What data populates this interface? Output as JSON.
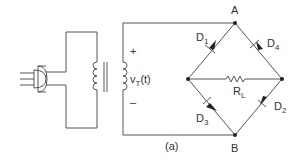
{
  "diagram": {
    "caption": "(a)",
    "source_label": "v",
    "source_sub": "T",
    "source_suffix": "(t)",
    "polarity_plus": "+",
    "polarity_minus": "–",
    "nodes": {
      "top": "A",
      "bottom": "B"
    },
    "diodes": [
      {
        "name": "D",
        "sub": "1"
      },
      {
        "name": "D",
        "sub": "2"
      },
      {
        "name": "D",
        "sub": "3"
      },
      {
        "name": "D",
        "sub": "4"
      }
    ],
    "load": {
      "name": "R",
      "sub": "L"
    },
    "colors": {
      "line": "#555555",
      "text": "#333333"
    }
  }
}
